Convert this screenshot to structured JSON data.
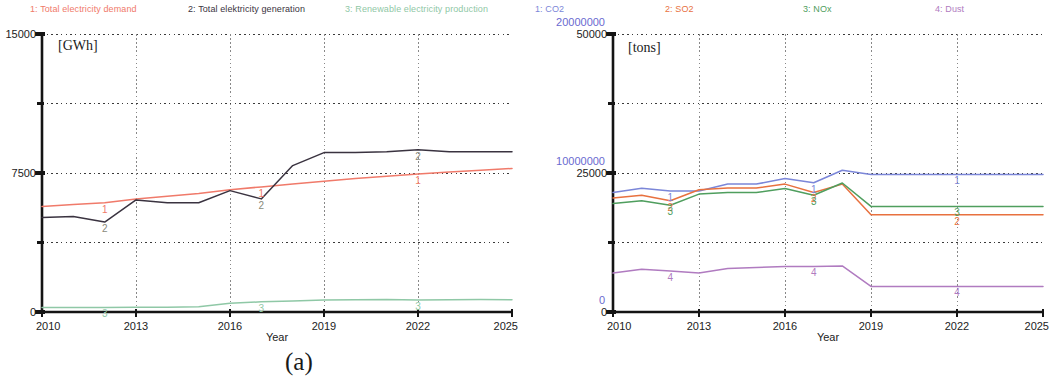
{
  "figure": {
    "caption_a": "(a)",
    "caption_b": "(b)"
  },
  "panel_a": {
    "legend": [
      {
        "label": "1: Total electricity demand",
        "color": "#f07a6a",
        "x": 30
      },
      {
        "label": "2: Total elektricity generation",
        "color": "#3a3340",
        "x": 188
      },
      {
        "label": "3: Renewable electricity production",
        "color": "#8fc8a6",
        "x": 345
      }
    ],
    "unit": "[GWh]",
    "y_ticks": [
      "15000",
      "7500",
      "0"
    ],
    "x_ticks": [
      "2010",
      "2013",
      "2016",
      "2019",
      "2022",
      "2025"
    ],
    "x_title": "Year",
    "markers": [
      {
        "n": "1",
        "color": "#f07a6a"
      },
      {
        "n": "2",
        "color": "#8a8a7a"
      },
      {
        "n": "3",
        "color": "#8fc8a6"
      }
    ]
  },
  "panel_b": {
    "legend": [
      {
        "label": "1: CO2",
        "color": "#7b86d8",
        "x": 10
      },
      {
        "label": "2: SO2",
        "color": "#e8713f",
        "x": 140
      },
      {
        "label": "3: NOx",
        "color": "#4f9e5e",
        "x": 278
      },
      {
        "label": "4: Dust",
        "color": "#b07bc0",
        "x": 410
      }
    ],
    "unit": "[tons]",
    "y_ticks_primary": [
      "50000",
      "25000",
      "0"
    ],
    "y_ticks_secondary": [
      "20000000",
      "10000000",
      "0"
    ],
    "x_ticks": [
      "2010",
      "2013",
      "2016",
      "2019",
      "2022",
      "2025"
    ],
    "x_title": "Year",
    "markers": [
      {
        "n": "1",
        "color": "#7b86d8"
      },
      {
        "n": "2",
        "color": "#e8713f"
      },
      {
        "n": "3",
        "color": "#4f9e5e"
      },
      {
        "n": "4",
        "color": "#b07bc0"
      }
    ]
  },
  "chart_data": [
    {
      "type": "line",
      "title": "(a) Electricity demand, generation and renewable production",
      "xlabel": "Year",
      "ylabel": "[GWh]",
      "xlim": [
        2010,
        2025
      ],
      "ylim": [
        0,
        15000
      ],
      "yticks": [
        0,
        7500,
        15000
      ],
      "xticks": [
        2010,
        2013,
        2016,
        2019,
        2022,
        2025
      ],
      "grid": true,
      "legend_position": "top",
      "x": [
        2010,
        2011,
        2012,
        2013,
        2014,
        2015,
        2016,
        2017,
        2018,
        2019,
        2020,
        2021,
        2022,
        2023,
        2024,
        2025
      ],
      "series": [
        {
          "name": "1: Total electricity demand",
          "color": "#f07a6a",
          "values": [
            5700,
            5800,
            5900,
            6100,
            6250,
            6400,
            6600,
            6750,
            6900,
            7050,
            7200,
            7330,
            7450,
            7550,
            7650,
            7750
          ]
        },
        {
          "name": "2: Total elektricity generation",
          "color": "#3a3340",
          "values": [
            5100,
            5150,
            4850,
            6050,
            5900,
            5900,
            6550,
            6100,
            7900,
            8600,
            8600,
            8650,
            8750,
            8650,
            8650,
            8650
          ]
        },
        {
          "name": "3: Renewable electricity production",
          "color": "#8fc8a6",
          "values": [
            250,
            250,
            250,
            260,
            260,
            280,
            470,
            550,
            600,
            640,
            660,
            680,
            650,
            660,
            670,
            660
          ]
        }
      ]
    },
    {
      "type": "line",
      "title": "(b) Emissions: CO2, SO2, NOx and Dust",
      "xlabel": "Year",
      "ylabel": "[tons]",
      "xlim": [
        2010,
        2025
      ],
      "ylim_primary": [
        0,
        50000
      ],
      "ylim_secondary": [
        0,
        20000000
      ],
      "yticks_primary": [
        0,
        25000,
        50000
      ],
      "yticks_secondary": [
        0,
        10000000,
        20000000
      ],
      "xticks": [
        2010,
        2013,
        2016,
        2019,
        2022,
        2025
      ],
      "grid": true,
      "legend_position": "top",
      "x": [
        2010,
        2011,
        2012,
        2013,
        2014,
        2015,
        2016,
        2017,
        2018,
        2019,
        2020,
        2021,
        2022,
        2023,
        2024,
        2025
      ],
      "series": [
        {
          "name": "1: CO2",
          "color": "#7b86d8",
          "axis": "secondary",
          "values": [
            8600000,
            8900000,
            8700000,
            8700000,
            9200000,
            9200000,
            9600000,
            9300000,
            10200000,
            9900000,
            9900000,
            9900000,
            9900000,
            9900000,
            9900000,
            9900000
          ]
        },
        {
          "name": "2: SO2",
          "color": "#e8713f",
          "axis": "primary",
          "values": [
            20500,
            21000,
            20000,
            22000,
            22300,
            22300,
            23000,
            21500,
            23000,
            17500,
            17500,
            17500,
            17500,
            17500,
            17500,
            17500
          ]
        },
        {
          "name": "3: NOx",
          "color": "#4f9e5e",
          "axis": "primary",
          "values": [
            19500,
            20000,
            19200,
            21200,
            21500,
            21500,
            22200,
            21000,
            23200,
            19000,
            19000,
            19000,
            19000,
            19000,
            19000,
            19000
          ]
        },
        {
          "name": "4: Dust",
          "color": "#b07bc0",
          "axis": "primary",
          "values": [
            7000,
            7700,
            7400,
            7000,
            7800,
            8000,
            8200,
            8200,
            8300,
            4600,
            4600,
            4600,
            4600,
            4600,
            4600,
            4600
          ]
        }
      ]
    }
  ]
}
